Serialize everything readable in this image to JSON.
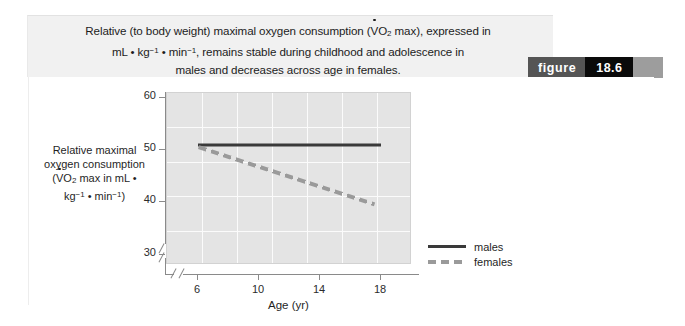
{
  "figure": {
    "badge_word": "figure",
    "badge_number": "18.6",
    "caption_line1_a": "Relative (to body weight) maximal oxygen consumption (",
    "caption_v": "V",
    "caption_o": "O",
    "caption_sub2": "2",
    "caption_line1_b": " max), expressed in",
    "caption_line2_a": "mL • kg",
    "caption_sup1": "−1",
    "caption_line2_b": " • min",
    "caption_sup2": "−1",
    "caption_line2_c": ", remains stable during childhood and adolescence in",
    "caption_line3": "males and decreases across age in females."
  },
  "chart_data": {
    "type": "line",
    "title": "",
    "xlabel": "Age (yr)",
    "ylabel_line1": "Relative maximal",
    "ylabel_line2": "oxygen consumption",
    "ylabel_line3_a": "(",
    "ylabel_v": "V",
    "ylabel_o": "O",
    "ylabel_sub2": "2",
    "ylabel_line3_b": " max in mL •",
    "ylabel_line4_a": "kg",
    "ylabel_sup1": "−1",
    "ylabel_line4_b": " • min",
    "ylabel_sup2": "−1",
    "ylabel_line4_c": ")",
    "x": [
      6,
      18
    ],
    "xlim": [
      4,
      20
    ],
    "ylim": [
      28,
      61
    ],
    "xticks": [
      "6",
      "10",
      "14",
      "18"
    ],
    "xtick_values": [
      6,
      10,
      14,
      18
    ],
    "yticks": [
      "30",
      "40",
      "50",
      "60"
    ],
    "ytick_values": [
      30,
      40,
      50,
      60
    ],
    "grid": true,
    "axis_break_x": true,
    "axis_break_y": true,
    "legend_position": "right",
    "series": [
      {
        "name": "males",
        "style": "solid",
        "color": "#3a3a3a",
        "x": [
          6,
          18
        ],
        "values": [
          51,
          51
        ]
      },
      {
        "name": "females",
        "style": "dashed",
        "color": "#9a9a9a",
        "x": [
          6,
          17.5
        ],
        "values": [
          50.6,
          39.6
        ]
      }
    ]
  },
  "colors": {
    "caption_band": "#f1f1f1",
    "plot_background": "#e4e4e4",
    "gridline": "#fbfbfb",
    "badge_word_bg": "#555555",
    "badge_num_bg": "#0a0a0a",
    "badge_tail_bg": "#9d9d9d"
  }
}
